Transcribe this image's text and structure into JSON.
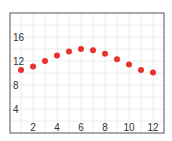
{
  "chart_data": {
    "type": "scatter",
    "title": "",
    "xlabel": "",
    "ylabel": "",
    "x": [
      1,
      2,
      3,
      4,
      5,
      6,
      7,
      8,
      9,
      10,
      11,
      12
    ],
    "series": [
      {
        "name": "",
        "values": [
          10.5,
          11.1,
          12.0,
          12.9,
          13.6,
          14.0,
          13.8,
          13.2,
          12.3,
          11.4,
          10.5,
          10.1
        ],
        "color": "#e8332a"
      }
    ],
    "xlim": [
      0,
      12.9
    ],
    "ylim": [
      0,
      20
    ],
    "xticks": [
      2,
      4,
      6,
      8,
      10,
      12
    ],
    "yticks": [
      4,
      8,
      12,
      16
    ],
    "grid": true,
    "legend": null
  },
  "style": {
    "frame_color": "#555555",
    "grid_color": "#ececec",
    "dot_color": "#e8332a",
    "tick_color": "#333333"
  }
}
